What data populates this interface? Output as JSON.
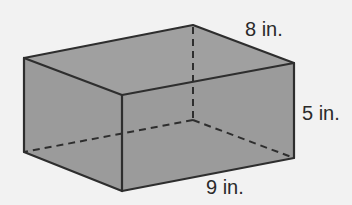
{
  "figure": {
    "type": "rectangular-prism",
    "colors": {
      "background": "#f2f2f2",
      "face_fill": "#9b9b9b",
      "edge": "#2e2e2e",
      "label_text": "#2a2a2a"
    },
    "dimensions": {
      "depth": {
        "value": 8,
        "unit": "in.",
        "label": "8 in."
      },
      "height": {
        "value": 5,
        "unit": "in.",
        "label": "5 in."
      },
      "length": {
        "value": 9,
        "unit": "in.",
        "label": "9 in."
      }
    }
  }
}
